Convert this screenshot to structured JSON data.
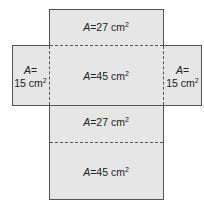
{
  "diagram": {
    "faces": [
      {
        "id": "top",
        "var": "A",
        "eq": "=",
        "value": "27 cm",
        "exp": "2"
      },
      {
        "id": "front",
        "var": "A",
        "eq": "=",
        "value": "45 cm",
        "exp": "2"
      },
      {
        "id": "left",
        "var": "A",
        "eq": "=",
        "value": "15 cm",
        "exp": "2"
      },
      {
        "id": "right",
        "var": "A",
        "eq": "=",
        "value": "15 cm",
        "exp": "2"
      },
      {
        "id": "bottom",
        "var": "A",
        "eq": "=",
        "value": "27 cm",
        "exp": "2"
      },
      {
        "id": "back",
        "var": "A",
        "eq": "=",
        "value": "45 cm",
        "exp": "2"
      }
    ],
    "colors": {
      "face": "#e6e6e6",
      "line": "#555555",
      "text": "#222222"
    }
  }
}
